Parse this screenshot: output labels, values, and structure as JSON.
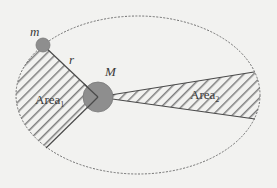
{
  "diagram": {
    "orbit": {
      "shape": "ellipse",
      "style": "dashed",
      "cx": 138,
      "cy": 95,
      "rx": 122,
      "ry": 79,
      "color": "#6f6f6f"
    },
    "bodies": {
      "planet": {
        "label": "m",
        "cx": 43,
        "cy": 45,
        "r": 7,
        "fill": "#8e8e8e"
      },
      "star": {
        "label": "M",
        "cx": 98,
        "cy": 97,
        "r": 15,
        "fill": "#8e8e8e"
      }
    },
    "radius_label": "r",
    "areas": [
      {
        "label": "Area",
        "subscript": "1",
        "points": "98,97 43,45 46,148"
      },
      {
        "label": "Area",
        "subscript": "2",
        "points": "98,97 254,72 255,119"
      }
    ],
    "colors": {
      "background": "#f2f2f0",
      "hatch": "#7e7e7e",
      "line": "#4a4a4a",
      "text": "#3a3a3a"
    }
  }
}
